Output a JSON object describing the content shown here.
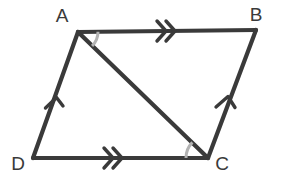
{
  "figure": {
    "kind": "parallelogram-with-diagonal",
    "background_color": "#ffffff",
    "stroke_color": "#3a3a3a",
    "arc_color": "#b3b3b3",
    "vertices": [
      {
        "name": "A",
        "label": "A",
        "x": 78,
        "y": 32,
        "label_x": 62,
        "label_y": 22
      },
      {
        "name": "B",
        "label": "B",
        "x": 256,
        "y": 30,
        "label_x": 256,
        "label_y": 21
      },
      {
        "name": "C",
        "label": "C",
        "x": 208,
        "y": 158,
        "label_x": 222,
        "label_y": 170
      },
      {
        "name": "D",
        "label": "D",
        "x": 33,
        "y": 158,
        "label_x": 18,
        "label_y": 170
      }
    ],
    "sides": [
      {
        "name": "side-ab",
        "from": "A",
        "to": "B",
        "ticks": 2,
        "tick_direction": "right"
      },
      {
        "name": "side-bc",
        "from": "B",
        "to": "C",
        "ticks": 1,
        "tick_direction": "up"
      },
      {
        "name": "side-dc",
        "from": "D",
        "to": "C",
        "ticks": 2,
        "tick_direction": "right"
      },
      {
        "name": "side-ad",
        "from": "A",
        "to": "D",
        "ticks": 1,
        "tick_direction": "up"
      }
    ],
    "diagonal": {
      "name": "diagonal-ac",
      "from": "A",
      "to": "C"
    },
    "angle_arcs": [
      {
        "name": "angle-arc-a",
        "vertex": "A",
        "between": "AC-to-AB",
        "radius": 20
      },
      {
        "name": "angle-arc-c",
        "vertex": "C",
        "between": "CD-to-CA",
        "radius": 22
      }
    ]
  }
}
